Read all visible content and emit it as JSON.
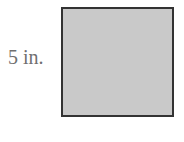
{
  "diagram": {
    "shape": "square",
    "side_label": "5 in.",
    "fill_color": "#c9c9c9",
    "border_color": "#333333",
    "label_color": "#6f6f6f"
  }
}
